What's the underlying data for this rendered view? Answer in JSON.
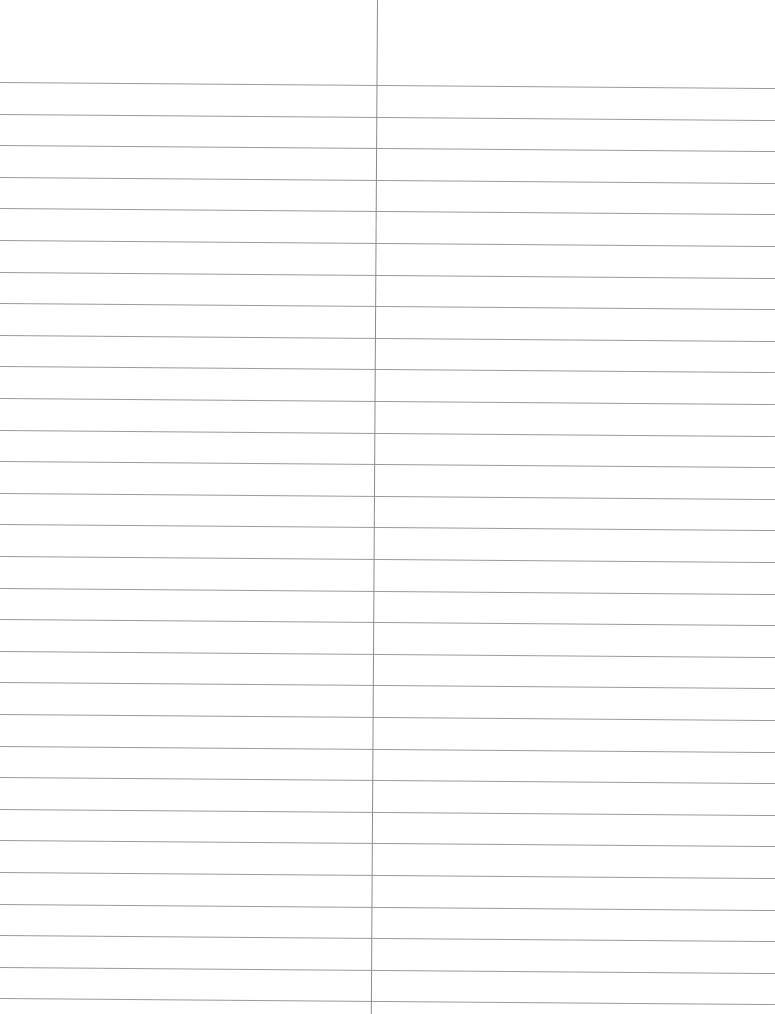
{
  "document": {
    "type": "ruled-paper",
    "width": 775,
    "height": 1014,
    "background": "#ffffff",
    "columns": [
      {
        "name": "left-column",
        "x": 0,
        "width": 376
      },
      {
        "name": "right-column",
        "x": 377,
        "width": 398
      }
    ],
    "divider": {
      "x": 377,
      "color": "#8c8c8c",
      "tilt_deg": 0.35
    },
    "rules": {
      "color": "#9a9a9a",
      "count": 30,
      "first_y": 82,
      "spacing": 31.6,
      "tilt_deg": 0.45
    },
    "text_content": []
  }
}
